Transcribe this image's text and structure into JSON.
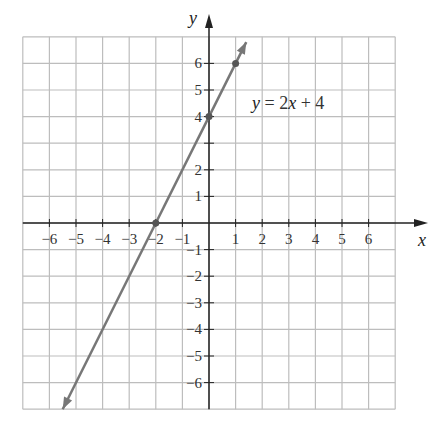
{
  "chart_data": {
    "type": "line",
    "title": "",
    "xlabel": "x",
    "ylabel": "y",
    "xlim": [
      -7,
      7
    ],
    "ylim": [
      -7,
      7
    ],
    "grid": true,
    "x_ticks": [
      -6,
      -5,
      -4,
      -3,
      -2,
      -1,
      1,
      2,
      3,
      4,
      5,
      6
    ],
    "y_ticks": [
      -6,
      -5,
      -4,
      -3,
      -2,
      -1,
      1,
      2,
      4,
      5,
      6
    ],
    "series": [
      {
        "name": "y = 2x + 4",
        "slope": 2,
        "intercept": 4,
        "x_range": [
          -5.5,
          1.4
        ]
      }
    ],
    "points": [
      {
        "x": -2,
        "y": 0
      },
      {
        "x": 0,
        "y": 4
      },
      {
        "x": 1,
        "y": 6
      }
    ],
    "annotation": {
      "text": "y = 2x + 4",
      "x": 0.8,
      "y": 4.8
    },
    "colors": {
      "line": "#777777",
      "grid": "#bdbdbd",
      "axis": "#222222"
    }
  },
  "labels": {
    "x_axis": "x",
    "y_axis": "y",
    "eq_y": "y",
    "eq_mid": " = 2",
    "eq_x": "x",
    "eq_end": " + 4"
  }
}
